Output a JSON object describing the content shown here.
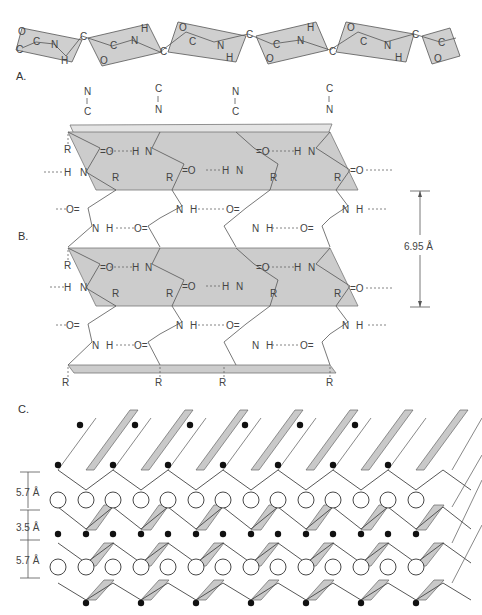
{
  "panels": {
    "a": {
      "label": "A.",
      "units": [
        {
          "atoms": [
            "O",
            "C",
            "C",
            "N",
            "H"
          ]
        },
        {
          "atoms": [
            "C",
            "O",
            "C",
            "N",
            "H"
          ]
        },
        {
          "atoms": [
            "C",
            "O",
            "C",
            "N",
            "H"
          ]
        },
        {
          "atoms": [
            "C",
            "O",
            "C",
            "N",
            "H"
          ]
        },
        {
          "atoms": [
            "C",
            "O",
            "C",
            "N",
            "H"
          ]
        },
        {
          "atoms": [
            "C",
            "O",
            "C"
          ]
        }
      ],
      "alpha_carbon": "C"
    },
    "b": {
      "label": "B.",
      "direction_markers": [
        {
          "top": "N",
          "bottom": "C",
          "arrow": "down"
        },
        {
          "top": "C",
          "bottom": "N",
          "arrow": "up"
        },
        {
          "top": "N",
          "bottom": "C",
          "arrow": "down"
        },
        {
          "top": "C",
          "bottom": "N",
          "arrow": "up"
        }
      ],
      "atoms": {
        "carbonyl": "=O",
        "hydrogen": "H",
        "nitrogen": "N",
        "sidechain": "R",
        "carbonyl_left": "O="
      },
      "spacing_label": "6.95 Å"
    },
    "c": {
      "label": "C.",
      "spacings": [
        "5.7 Å",
        "3.5 Å",
        "5.7 Å"
      ]
    }
  }
}
